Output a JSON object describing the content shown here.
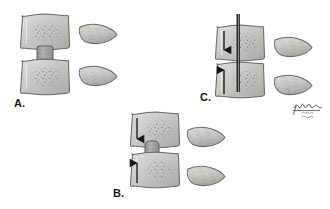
{
  "figure": {
    "background_color": "#ffffff",
    "width": 330,
    "height": 209,
    "artist_signature": {
      "name": "artist-signature",
      "text": "",
      "description": "handwritten illegible artist signature with small script lines beneath"
    }
  },
  "palette": {
    "vertebra_fill_light": "#d8d8d4",
    "vertebra_fill_mid": "#bfbfba",
    "vertebra_fill_shadow": "#a8a8a2",
    "vertebra_outline": "#6b6b66",
    "trabecular_speckle": "#6e6e68",
    "disc_fill": "#a9a9a3",
    "disc_outline": "#5f5f5a",
    "process_fill": "#cfcfc9",
    "process_outline": "#6b6b66",
    "arrow_color": "#161616",
    "needle_color": "#141414",
    "needle_core": "#8c8c87",
    "label_color": "#1a1a1a"
  },
  "panels": [
    {
      "id": "panel-a",
      "label": "A.",
      "label_x": 14,
      "label_y": 98,
      "caption": "Normal disc height between two vertebral bodies",
      "vertebrae": [
        {
          "name": "upper-vertebral-body",
          "x": 20,
          "y": 14,
          "w": 50,
          "h": 36
        },
        {
          "name": "lower-vertebral-body",
          "x": 20,
          "y": 59,
          "w": 50,
          "h": 36
        }
      ],
      "disc": {
        "name": "intervertebral-disc",
        "x": 37,
        "y": 46,
        "w": 16,
        "h": 17,
        "state": "normal"
      },
      "arrows": [],
      "needle": null,
      "spinous_processes": [
        {
          "name": "upper-spinous-process",
          "x": 78,
          "y": 23,
          "w": 40,
          "h": 22
        },
        {
          "name": "lower-spinous-process",
          "x": 78,
          "y": 65,
          "w": 40,
          "h": 22
        }
      ]
    },
    {
      "id": "panel-b",
      "label": "B.",
      "label_x": 113,
      "label_y": 188,
      "caption": "Axial compression narrows the segment and the disc bulges",
      "vertebrae": [
        {
          "name": "upper-vertebral-body",
          "x": 130,
          "y": 112,
          "w": 50,
          "h": 36
        },
        {
          "name": "lower-vertebral-body",
          "x": 130,
          "y": 152,
          "w": 50,
          "h": 36
        }
      ],
      "disc": {
        "name": "intervertebral-disc",
        "x": 145,
        "y": 141,
        "w": 14,
        "h": 22,
        "state": "compressed-bulging"
      },
      "arrows": [
        {
          "name": "compression-arrow-down",
          "x": 137,
          "y1": 118,
          "y2": 140,
          "direction": "down"
        },
        {
          "name": "compression-arrow-up",
          "x": 137,
          "y1": 183,
          "y2": 161,
          "direction": "up"
        }
      ],
      "needle": null,
      "spinous_processes": [
        {
          "name": "upper-spinous-process",
          "x": 186,
          "y": 126,
          "w": 40,
          "h": 22
        },
        {
          "name": "lower-spinous-process",
          "x": 186,
          "y": 165,
          "w": 40,
          "h": 22
        }
      ]
    },
    {
      "id": "panel-c",
      "label": "C.",
      "label_x": 200,
      "label_y": 92,
      "caption": "Needle passed through the collapsed disc space with distraction arrows",
      "vertebrae": [
        {
          "name": "upper-vertebral-body",
          "x": 215,
          "y": 25,
          "w": 50,
          "h": 36
        },
        {
          "name": "lower-vertebral-body",
          "x": 215,
          "y": 62,
          "w": 50,
          "h": 36
        }
      ],
      "disc": {
        "name": "intervertebral-disc",
        "x": 0,
        "y": 0,
        "w": 0,
        "h": 0,
        "state": "collapsed"
      },
      "arrows": [
        {
          "name": "distraction-arrow-down",
          "x": 224,
          "y1": 31,
          "y2": 53,
          "direction": "down"
        },
        {
          "name": "distraction-arrow-up",
          "x": 224,
          "y1": 94,
          "y2": 68,
          "direction": "up"
        }
      ],
      "needle": {
        "name": "needle-cannula",
        "x": 238,
        "y1": 14,
        "y2": 92,
        "width": 3
      },
      "spinous_processes": [
        {
          "name": "upper-spinous-process",
          "x": 273,
          "y": 36,
          "w": 40,
          "h": 22
        },
        {
          "name": "lower-spinous-process",
          "x": 273,
          "y": 74,
          "w": 40,
          "h": 22
        }
      ]
    }
  ]
}
